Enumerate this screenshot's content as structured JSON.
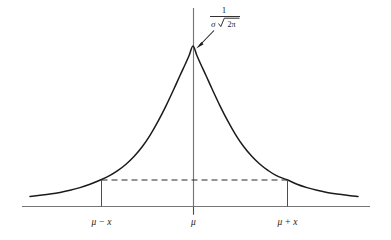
{
  "figure": {
    "background_color": "#ffffff",
    "curve_color": "#1b1b1b",
    "axis_color": "#767676",
    "dash_color": "#2b2b2b"
  },
  "annotation": {
    "peak_formula_numerator": "1",
    "peak_formula_sigma": "σ",
    "peak_formula_radicand": "2π",
    "peak_formula_plain": "1 / (σ√(2π))",
    "arrow_name": "peak-value-arrow"
  },
  "axis_labels": {
    "left": "μ − x",
    "center": "μ",
    "right": "μ + x"
  },
  "chart_data": {
    "type": "line",
    "title": "",
    "xlabel": "",
    "ylabel": "",
    "grid": false,
    "legend": false,
    "tick_labels": [
      "μ − x",
      "μ",
      "μ + x"
    ],
    "tick_pixel_x": [
      101,
      193,
      287
    ],
    "peak_label": "1 / (σ√(2π))",
    "dashed_level_pixel_y": 180,
    "baseline_pixel_y": 206,
    "curve_points": [
      [
        30,
        196.5
      ],
      [
        40,
        195.3
      ],
      [
        50,
        194.0
      ],
      [
        60,
        192.4
      ],
      [
        70,
        190.3
      ],
      [
        80,
        187.6
      ],
      [
        90,
        184.2
      ],
      [
        101,
        179.8
      ],
      [
        110,
        175.4
      ],
      [
        118,
        170.4
      ],
      [
        126,
        164.2
      ],
      [
        134,
        156.5
      ],
      [
        142,
        147.0
      ],
      [
        150,
        135.3
      ],
      [
        158,
        121.4
      ],
      [
        166,
        105.8
      ],
      [
        174,
        88.8
      ],
      [
        180,
        75.5
      ],
      [
        185,
        64.8
      ],
      [
        189,
        55.8
      ],
      [
        193,
        46.0
      ],
      [
        197,
        55.8
      ],
      [
        201,
        64.8
      ],
      [
        206,
        75.5
      ],
      [
        212,
        88.8
      ],
      [
        220,
        105.8
      ],
      [
        228,
        121.4
      ],
      [
        236,
        135.3
      ],
      [
        244,
        147.0
      ],
      [
        252,
        156.5
      ],
      [
        260,
        164.2
      ],
      [
        268,
        170.4
      ],
      [
        276,
        175.4
      ],
      [
        287,
        179.8
      ],
      [
        297,
        184.2
      ],
      [
        307,
        187.6
      ],
      [
        317,
        190.3
      ],
      [
        327,
        192.4
      ],
      [
        337,
        194.0
      ],
      [
        347,
        195.3
      ],
      [
        358,
        196.5
      ]
    ]
  }
}
